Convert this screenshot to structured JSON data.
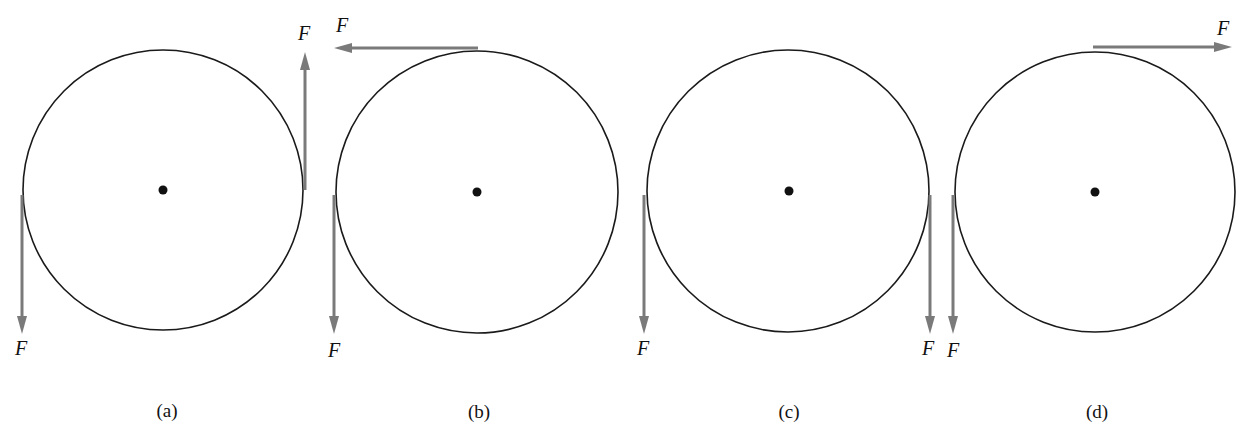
{
  "figure": {
    "type": "force-diagram",
    "colors": {
      "disk": "#1a1a1a",
      "force": "#7a7a7a",
      "axle": "#111111"
    },
    "panels": [
      {
        "caption": "(a)",
        "forces": [
          {
            "label": "F",
            "point": "left edge",
            "direction": "down"
          },
          {
            "label": "F",
            "point": "right edge",
            "direction": "up"
          }
        ]
      },
      {
        "caption": "(b)",
        "forces": [
          {
            "label": "F",
            "point": "top",
            "direction": "left"
          },
          {
            "label": "F",
            "point": "left edge",
            "direction": "down"
          }
        ]
      },
      {
        "caption": "(c)",
        "forces": [
          {
            "label": "F",
            "point": "left edge",
            "direction": "down"
          },
          {
            "label": "F",
            "point": "right edge",
            "direction": "down"
          }
        ]
      },
      {
        "caption": "(d)",
        "forces": [
          {
            "label": "F",
            "point": "top",
            "direction": "right"
          },
          {
            "label": "F",
            "point": "left edge",
            "direction": "down"
          }
        ]
      }
    ]
  }
}
